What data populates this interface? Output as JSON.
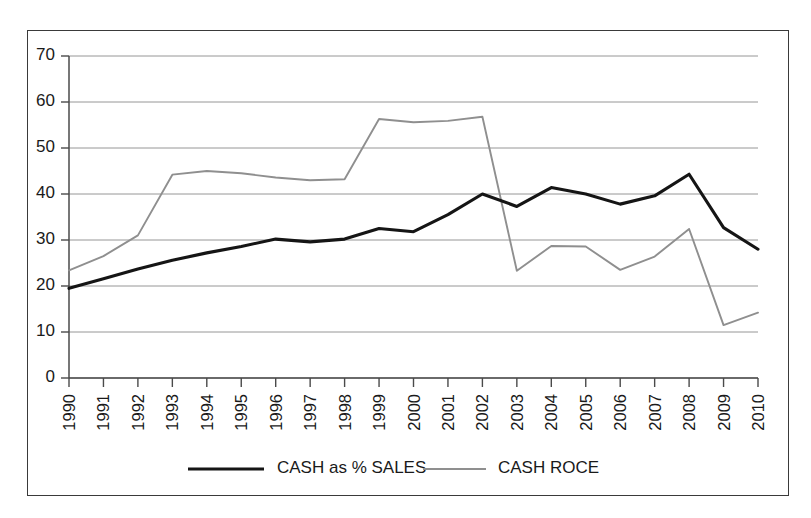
{
  "chart_data": {
    "type": "line",
    "title": "",
    "subtitle": "",
    "xlabel": "",
    "ylabel": "",
    "categories": [
      "1990",
      "1991",
      "1992",
      "1993",
      "1994",
      "1995",
      "1996",
      "1997",
      "1998",
      "1999",
      "2000",
      "2001",
      "2002",
      "2003",
      "2004",
      "2005",
      "2006",
      "2007",
      "2008",
      "2009",
      "2010"
    ],
    "series": [
      {
        "name": "CASH as % SALES",
        "color": "#151515",
        "line_style": "thick-solid",
        "values": [
          19.5,
          21.6,
          23.7,
          25.6,
          27.2,
          28.6,
          30.2,
          29.6,
          30.2,
          32.5,
          31.8,
          35.5,
          40.0,
          37.3,
          41.4,
          40.0,
          37.8,
          39.6,
          44.3,
          32.7,
          28.0
        ]
      },
      {
        "name": "CASH ROCE",
        "color": "#8f8f8f",
        "line_style": "thin-solid",
        "values": [
          23.4,
          26.5,
          31.0,
          44.2,
          45.0,
          44.5,
          43.6,
          43.0,
          43.2,
          56.3,
          55.6,
          55.9,
          56.8,
          23.3,
          28.7,
          28.6,
          23.5,
          26.4,
          32.4,
          11.5,
          14.2
        ]
      }
    ],
    "ylim": [
      0,
      70
    ],
    "yticks": [
      0,
      10,
      20,
      30,
      40,
      50,
      60,
      70
    ],
    "ytick_labels": [
      "0",
      "10",
      "20",
      "30",
      "40",
      "50",
      "60",
      "70"
    ],
    "grid": true,
    "grid_axis": "y",
    "legend_position": "bottom",
    "xtick_rotation": 90
  },
  "legend": {
    "entries": [
      {
        "label": "CASH as % SALES"
      },
      {
        "label": "CASH ROCE"
      }
    ]
  }
}
